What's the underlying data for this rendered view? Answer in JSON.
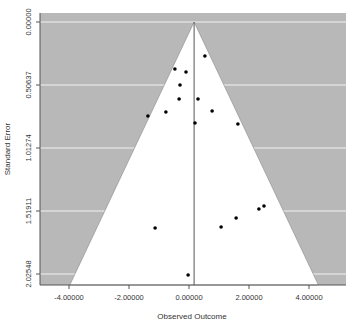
{
  "chart_data": {
    "type": "scatter",
    "subtype": "funnel-plot",
    "title": "",
    "xlabel": "Observed Outcome",
    "ylabel": "Standard Error",
    "xlim": [
      -5.03,
      5.23
    ],
    "ylim": [
      2.114,
      -0.072
    ],
    "y_reversed": true,
    "x_ticks": [
      -4,
      -2,
      0,
      2,
      4
    ],
    "x_tick_labels": [
      "-4.00000",
      "-2.00000",
      "0.00000",
      "2.00000",
      "4.00000"
    ],
    "y_ticks": [
      0,
      0.50637,
      1.01274,
      1.51911,
      2.02548
    ],
    "y_tick_labels": [
      "0.00000",
      "0.50637",
      "1.01274",
      "1.51911",
      "2.02548"
    ],
    "grid": "horizontal-white",
    "reference_line_x": 0.17,
    "funnel_multiplier": 1.96,
    "colors": {
      "outside_region": "#b8b8b8",
      "inside_region": "#ffffff",
      "gridline": "#f2f2f2",
      "points": "#000000",
      "lines": "#555555"
    },
    "points": [
      {
        "x": 0.53,
        "se": 0.273
      },
      {
        "x": -0.47,
        "se": 0.378
      },
      {
        "x": -0.1,
        "se": 0.402
      },
      {
        "x": -0.3,
        "se": 0.506
      },
      {
        "x": -0.33,
        "se": 0.619
      },
      {
        "x": 0.3,
        "se": 0.619
      },
      {
        "x": -1.37,
        "se": 0.756
      },
      {
        "x": -0.77,
        "se": 0.723
      },
      {
        "x": 0.2,
        "se": 0.812
      },
      {
        "x": 0.77,
        "se": 0.715
      },
      {
        "x": 1.63,
        "se": 0.82
      },
      {
        "x": -1.13,
        "se": 1.656
      },
      {
        "x": -0.03,
        "se": 2.034
      },
      {
        "x": 1.07,
        "se": 1.648
      },
      {
        "x": 1.57,
        "se": 1.575
      },
      {
        "x": 2.33,
        "se": 1.503
      },
      {
        "x": 2.5,
        "se": 1.479
      }
    ]
  },
  "layout": {
    "plot_left": 40,
    "plot_right": 346,
    "plot_top": 13,
    "plot_bottom": 285
  }
}
